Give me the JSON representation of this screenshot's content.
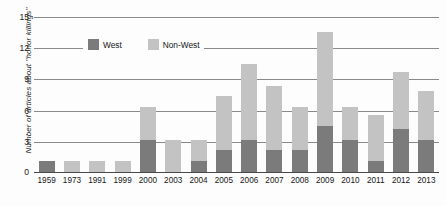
{
  "chart_data": {
    "type": "bar",
    "stacked": true,
    "title": "",
    "xlabel": "",
    "ylabel": "Number of articles about \"honor killings\"",
    "ylim": [
      0,
      15
    ],
    "yticks": [
      0,
      3,
      6,
      9,
      12,
      15
    ],
    "grid": true,
    "legend_position": "top-left-inside",
    "categories": [
      "1959",
      "1973",
      "1991",
      "1999",
      "2000",
      "2003",
      "2004",
      "2005",
      "2006",
      "2007",
      "2008",
      "2009",
      "2010",
      "2011",
      "2012",
      "2013"
    ],
    "series": [
      {
        "name": "West",
        "color": "#7b7b7b",
        "values": [
          1,
          0,
          0,
          0,
          3,
          0,
          1,
          2,
          3,
          2,
          2,
          4.3,
          3,
          1,
          4,
          3
        ]
      },
      {
        "name": "Non-West",
        "color": "#c3c3c3",
        "values": [
          0,
          1,
          1,
          1,
          3,
          3,
          2,
          5,
          7,
          6,
          4,
          8.7,
          3,
          4.3,
          5.3,
          4.5
        ]
      }
    ],
    "totals": [
      1,
      1,
      1,
      1,
      6,
      3,
      3,
      7,
      10,
      8,
      6,
      13,
      6,
      5.3,
      9.3,
      7.5
    ]
  },
  "legend": {
    "items": [
      {
        "label": "West",
        "swatch": "west-swatch"
      },
      {
        "label": "Non-West",
        "swatch": "non-west-swatch"
      }
    ]
  },
  "axes": {
    "y_title": "Number of articles about \"honor killings\"",
    "y_ticks": [
      "15",
      "12",
      "9",
      "6",
      "3",
      "0"
    ],
    "x_ticks": [
      "1959",
      "1973",
      "1991",
      "1999",
      "2000",
      "2003",
      "2004",
      "2005",
      "2006",
      "2007",
      "2008",
      "2009",
      "2010",
      "2011",
      "2012",
      "2013"
    ]
  },
  "colors": {
    "west": "#7b7b7b",
    "non_west": "#c3c3c3",
    "gridline": "#8a8a8a",
    "axis": "#4a4a4a",
    "background": "#fdfdfd"
  }
}
